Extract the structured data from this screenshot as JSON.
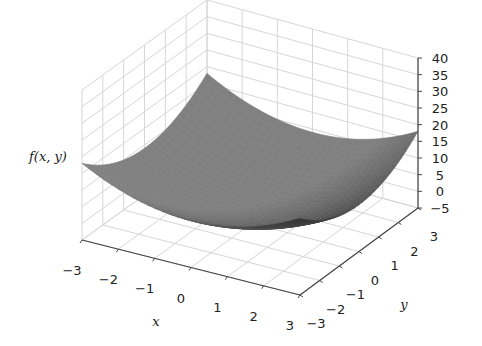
{
  "chart_data": {
    "type": "surface3d",
    "function": "f(x,y) = x^2 + y^2 (approx.)",
    "title": "",
    "xlabel": "x",
    "ylabel": "y",
    "zlabel": "f(x,y)",
    "x_ticks": [
      "−3",
      "−2",
      "−1",
      "0",
      "1",
      "2",
      "3"
    ],
    "y_ticks": [
      "−3",
      "−2",
      "−1",
      "0",
      "1",
      "2",
      "3"
    ],
    "z_ticks": [
      "−5",
      "0",
      "5",
      "10",
      "15",
      "20",
      "25",
      "30",
      "35",
      "40"
    ],
    "xlim": [
      -3,
      3
    ],
    "ylim": [
      -3,
      3
    ],
    "zlim": [
      -5,
      40
    ],
    "grid": true,
    "colormap": "gray",
    "surface_color": "#555555",
    "sample_points": {
      "x": [
        -3,
        -2,
        -1,
        0,
        1,
        2,
        3
      ],
      "y": [
        -3,
        -2,
        -1,
        0,
        1,
        2,
        3
      ],
      "z_diagonal": [
        18,
        8,
        2,
        0,
        2,
        8,
        18
      ],
      "z_corners": {
        "(-3,-3)": 18,
        "(-3,3)": 18,
        "(3,-3)": 18,
        "(3,3)": 18
      },
      "z_min": 0
    }
  },
  "labels": {
    "x_axis": "x",
    "y_axis": "y",
    "z_axis": "f(x, y)"
  }
}
